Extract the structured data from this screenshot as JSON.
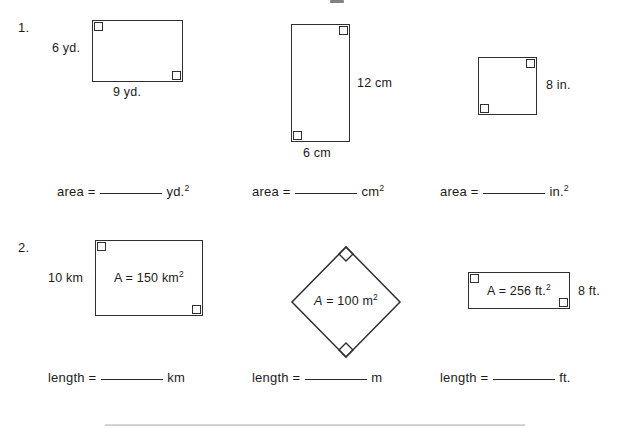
{
  "worksheet": {
    "background_color": "#ffffff",
    "line_color": "#2f2f2f",
    "text_color": "#1b1b1b"
  },
  "problems": [
    {
      "number": "1.",
      "figures": [
        {
          "shape": "rectangle",
          "left_label": "6 yd.",
          "bottom_label": "9 yd.",
          "right_angles": [
            "top-left",
            "bottom-right"
          ],
          "answer_prompt": "area =",
          "answer_unit": "yd.",
          "answer_unit_exponent": "2"
        },
        {
          "shape": "rectangle",
          "right_label": "12 cm",
          "bottom_label": "6 cm",
          "right_angles": [
            "top-right",
            "bottom-left"
          ],
          "answer_prompt": "area =",
          "answer_unit": "cm",
          "answer_unit_exponent": "2"
        },
        {
          "shape": "square",
          "right_label": "8 in.",
          "right_angles": [
            "top-right",
            "bottom-left"
          ],
          "answer_prompt": "area =",
          "answer_unit": "in.",
          "answer_unit_exponent": "2"
        }
      ]
    },
    {
      "number": "2.",
      "figures": [
        {
          "shape": "rectangle",
          "left_label": "10 km",
          "inner_area_var": "A",
          "inner_area_text": " = 150 km",
          "inner_area_exponent": "2",
          "right_angles": [
            "top-left",
            "bottom-right"
          ],
          "answer_prompt": "length =",
          "answer_unit": "km"
        },
        {
          "shape": "diamond",
          "inner_area_var": "A",
          "inner_area_text": " = 100 m",
          "inner_area_exponent": "2",
          "right_angles": [
            "top-vertex",
            "bottom-vertex"
          ],
          "answer_prompt": "length =",
          "answer_unit": "m"
        },
        {
          "shape": "rectangle",
          "right_label": "8 ft.",
          "inner_area_var": "A",
          "inner_area_text": " = 256 ft.",
          "inner_area_exponent": "2",
          "right_angles": [
            "top-left",
            "bottom-right"
          ],
          "answer_prompt": "length =",
          "answer_unit": "ft."
        }
      ]
    }
  ]
}
